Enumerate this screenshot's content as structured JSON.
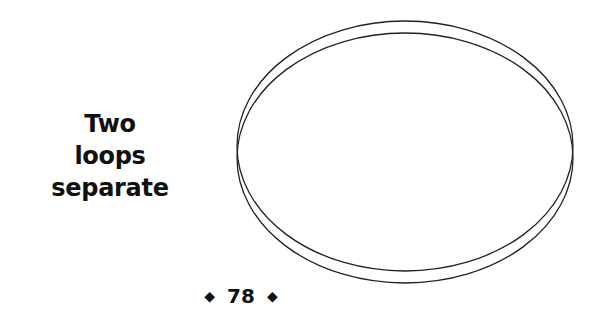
{
  "caption": {
    "lines": [
      "Two",
      "loops",
      "separate"
    ]
  },
  "figure": {
    "stroke_color": "#222222",
    "ellipses": [
      {
        "cx": 405,
        "cy": 146,
        "rx": 168,
        "ry": 125
      },
      {
        "cx": 405,
        "cy": 158,
        "rx": 168,
        "ry": 125
      }
    ]
  },
  "footer": {
    "page_number": "78",
    "left_ornament": "◆",
    "right_ornament": "◆"
  }
}
